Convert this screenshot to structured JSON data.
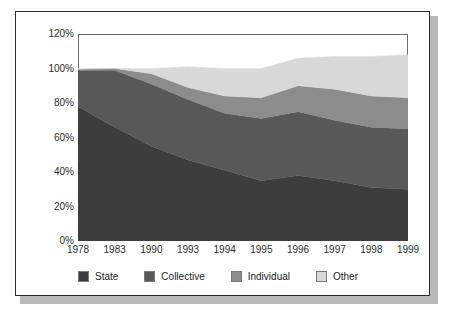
{
  "chart_data": {
    "type": "area",
    "stacked": true,
    "title": "",
    "subtitle": "",
    "xlabel": "",
    "ylabel": "",
    "categories": [
      "1978",
      "1983",
      "1990",
      "1993",
      "1994",
      "1995",
      "1996",
      "1997",
      "1998",
      "1999"
    ],
    "ylim": [
      0,
      120
    ],
    "yticks": [
      0,
      20,
      40,
      60,
      80,
      100,
      120
    ],
    "ytick_labels": [
      "0%",
      "20%",
      "40%",
      "60%",
      "80%",
      "100%",
      "120%"
    ],
    "grid": false,
    "legend_position": "bottom",
    "series": [
      {
        "name": "State",
        "color": "#3d3d3d",
        "values": [
          78,
          66,
          55,
          47,
          41,
          35,
          38,
          35,
          31,
          30
        ]
      },
      {
        "name": "Collective",
        "color": "#585858",
        "values": [
          21,
          33,
          36,
          35,
          33,
          36,
          37,
          35,
          35,
          35
        ]
      },
      {
        "name": "Individual",
        "color": "#8c8c8c",
        "values": [
          0.5,
          1,
          6,
          7,
          10,
          12,
          15,
          18,
          18,
          18
        ]
      },
      {
        "name": "Other",
        "color": "#d8d8d8",
        "values": [
          0.5,
          0,
          3,
          12,
          16,
          17,
          16,
          19,
          23,
          25
        ]
      }
    ],
    "stack_tops": {
      "State": [
        78,
        66,
        55,
        47,
        41,
        35,
        38,
        35,
        31,
        30
      ],
      "Collective": [
        99,
        99,
        91,
        82,
        74,
        71,
        75,
        70,
        66,
        65
      ],
      "Individual": [
        99.5,
        100,
        97,
        89,
        84,
        83,
        90,
        88,
        84,
        83
      ],
      "Other": [
        100,
        100,
        100,
        101,
        100,
        100,
        106,
        107,
        107,
        108
      ]
    }
  },
  "axes": {
    "ytick_labels": [
      "120%",
      "100%",
      "80%",
      "60%",
      "40%",
      "20%",
      "0%"
    ],
    "xtick_labels": [
      "1978",
      "1983",
      "1990",
      "1993",
      "1994",
      "1995",
      "1996",
      "1997",
      "1998",
      "1999"
    ]
  },
  "legend": {
    "entries": [
      {
        "label": "State",
        "color": "#3d3d3d"
      },
      {
        "label": "Collective",
        "color": "#585858"
      },
      {
        "label": "Individual",
        "color": "#8c8c8c"
      },
      {
        "label": "Other",
        "color": "#d8d8d8"
      }
    ]
  }
}
